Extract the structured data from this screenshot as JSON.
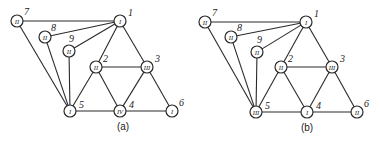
{
  "figure": {
    "panels": [
      {
        "id": "a",
        "label": "(a)",
        "label_pos": [
          123,
          130
        ],
        "node_radius": 6,
        "nodes": [
          {
            "num": "1",
            "roman": "I",
            "x": 120,
            "y": 21,
            "num_dx": 8,
            "num_dy": -5
          },
          {
            "num": "2",
            "roman": "II",
            "x": 96,
            "y": 67,
            "num_dx": 7,
            "num_dy": -5
          },
          {
            "num": "3",
            "roman": "III",
            "x": 147,
            "y": 67,
            "num_dx": 8,
            "num_dy": -5
          },
          {
            "num": "4",
            "roman": "IV",
            "x": 120,
            "y": 111,
            "num_dx": 9,
            "num_dy": -3
          },
          {
            "num": "5",
            "roman": "I",
            "x": 70,
            "y": 111,
            "num_dx": 9,
            "num_dy": -3
          },
          {
            "num": "6",
            "roman": "I",
            "x": 172,
            "y": 111,
            "num_dx": 7,
            "num_dy": -5
          },
          {
            "num": "7",
            "roman": "II",
            "x": 17,
            "y": 21,
            "num_dx": 7,
            "num_dy": -6
          },
          {
            "num": "8",
            "roman": "II",
            "x": 45,
            "y": 37,
            "num_dx": 6,
            "num_dy": -6
          },
          {
            "num": "9",
            "roman": "II",
            "x": 69,
            "y": 51,
            "num_dx": 0,
            "num_dy": -9
          }
        ],
        "edges": [
          [
            7,
            1
          ],
          [
            8,
            1
          ],
          [
            9,
            1
          ],
          [
            1,
            2
          ],
          [
            1,
            3
          ],
          [
            2,
            3
          ],
          [
            2,
            5
          ],
          [
            2,
            4
          ],
          [
            3,
            4
          ],
          [
            3,
            6
          ],
          [
            5,
            4
          ],
          [
            4,
            6
          ],
          [
            7,
            5
          ],
          [
            8,
            5
          ],
          [
            9,
            5
          ]
        ]
      },
      {
        "id": "b",
        "label": "(b)",
        "label_pos": [
          307,
          131
        ],
        "node_radius": 6,
        "nodes": [
          {
            "num": "1",
            "roman": "I",
            "x": 306,
            "y": 22,
            "num_dx": 8,
            "num_dy": -5
          },
          {
            "num": "2",
            "roman": "II",
            "x": 281,
            "y": 67,
            "num_dx": 7,
            "num_dy": -5
          },
          {
            "num": "3",
            "roman": "III",
            "x": 332,
            "y": 67,
            "num_dx": 8,
            "num_dy": -5
          },
          {
            "num": "4",
            "roman": "I",
            "x": 307,
            "y": 112,
            "num_dx": 9,
            "num_dy": -3
          },
          {
            "num": "5",
            "roman": "III",
            "x": 256,
            "y": 112,
            "num_dx": 9,
            "num_dy": -3
          },
          {
            "num": "6",
            "roman": "II",
            "x": 357,
            "y": 112,
            "num_dx": 7,
            "num_dy": -5
          },
          {
            "num": "7",
            "roman": "II",
            "x": 205,
            "y": 22,
            "num_dx": 7,
            "num_dy": -6
          },
          {
            "num": "8",
            "roman": "II",
            "x": 231,
            "y": 37,
            "num_dx": 6,
            "num_dy": -6
          },
          {
            "num": "9",
            "roman": "II",
            "x": 257,
            "y": 52,
            "num_dx": 0,
            "num_dy": -9
          }
        ],
        "edges": [
          [
            7,
            1
          ],
          [
            8,
            1
          ],
          [
            9,
            1
          ],
          [
            1,
            2
          ],
          [
            1,
            3
          ],
          [
            2,
            3
          ],
          [
            2,
            5
          ],
          [
            2,
            4
          ],
          [
            3,
            4
          ],
          [
            3,
            6
          ],
          [
            5,
            4
          ],
          [
            4,
            6
          ],
          [
            7,
            5
          ],
          [
            8,
            5
          ],
          [
            9,
            5
          ]
        ]
      }
    ]
  }
}
